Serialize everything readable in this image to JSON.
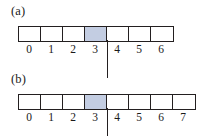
{
  "figure": {
    "colors": {
      "shaded_cell": "#c3cde2",
      "stroke": "#231f20",
      "background": "#ffffff"
    },
    "panels": [
      {
        "id": "a",
        "label": "(a)",
        "cell_count": 7,
        "tick_labels": [
          "0",
          "1",
          "2",
          "3",
          "4",
          "5",
          "6"
        ],
        "shaded_index": 3,
        "split_after_index": 3
      },
      {
        "id": "b",
        "label": "(b)",
        "cell_count": 8,
        "tick_labels": [
          "0",
          "1",
          "2",
          "3",
          "4",
          "5",
          "6",
          "7"
        ],
        "shaded_index": 3,
        "split_after_index": 3
      }
    ]
  }
}
